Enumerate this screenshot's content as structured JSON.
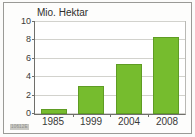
{
  "chart_data": {
    "type": "bar",
    "title": "Mio. Hektar",
    "xlabel": "",
    "ylabel": "Mio. Hektar",
    "categories": [
      "1985",
      "1999",
      "2004",
      "2008"
    ],
    "values": [
      0.5,
      3.0,
      5.4,
      8.4
    ],
    "series": [
      {
        "name": "Mio. Hektar",
        "values": [
          0.5,
          3.0,
          5.4,
          8.4
        ]
      }
    ],
    "ylim": [
      0,
      10
    ],
    "yticks": [
      0,
      2,
      4,
      6,
      8,
      10
    ],
    "ytick_labels": [
      "0",
      "2",
      "4",
      "6",
      "8",
      "10"
    ],
    "grid": true,
    "legend": false,
    "legend_position": "none",
    "bar_color": "#76bc2e",
    "bar_edge_color": "#5f9c24",
    "grid_color": "#d2d2cd",
    "axis_color": "#6f6f6b",
    "plot_background": "#ffffff",
    "figure_background": "#fdfdfc",
    "frame_color": "#9a9a96"
  },
  "annotations": {
    "source_code": "10612E"
  }
}
